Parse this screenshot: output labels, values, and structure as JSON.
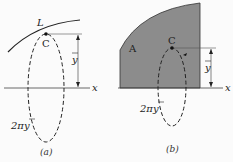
{
  "figure_a": {
    "curve_label": "L",
    "centroid_label": "C",
    "distance_label": "y",
    "axis_label": "x",
    "circumference_label": "2πy",
    "caption": "(a)"
  },
  "figure_b": {
    "area_label": "A",
    "centroid_label": "C",
    "distance_label": "y",
    "axis_label": "x",
    "circumference_label": "2πy",
    "caption": "(b)"
  },
  "colors": {
    "area_fill": "#8c8c8c",
    "line": "#222222"
  }
}
